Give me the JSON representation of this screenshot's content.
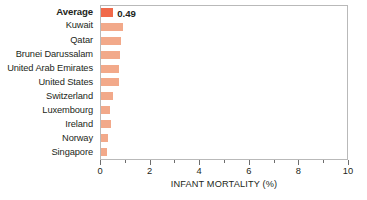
{
  "chart_data": {
    "type": "bar",
    "orientation": "horizontal",
    "title": "",
    "xlabel": "INFANT MORTALITY (%)",
    "ylabel": "",
    "xlim": [
      0,
      10
    ],
    "grid": false,
    "legend": null,
    "tick_labels": [
      "0",
      "2",
      "4",
      "6",
      "8",
      "10"
    ],
    "tick_values": [
      0,
      2,
      4,
      6,
      8,
      10
    ],
    "minor_tick_values": [
      1,
      3,
      5,
      7,
      9
    ],
    "categories": [
      "Average",
      "Kuwait",
      "Qatar",
      "Brunei Darussalam",
      "United Arab Emirates",
      "United States",
      "Switzerland",
      "Luxembourg",
      "Ireland",
      "Norway",
      "Singapore"
    ],
    "values": [
      0.49,
      0.89,
      0.82,
      0.78,
      0.74,
      0.73,
      0.48,
      0.38,
      0.39,
      0.28,
      0.25
    ],
    "data_labels": [
      "0.49",
      "",
      "",
      "",
      "",
      "",
      "",
      "",
      "",
      "",
      ""
    ],
    "highlight_index": 0,
    "colors": {
      "bar": "#f2a98a",
      "bar_highlight": "#f0694a",
      "axis": "#6d6d6d",
      "frame": "#b9b9b9",
      "text": "#231f20",
      "background": "#ffffff"
    }
  }
}
